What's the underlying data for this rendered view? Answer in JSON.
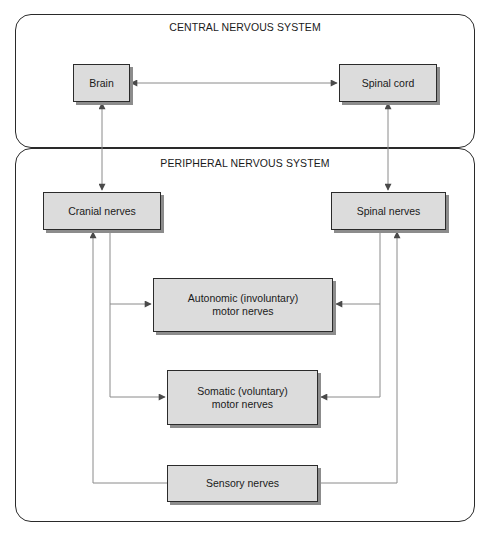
{
  "diagram": {
    "panels": {
      "central": {
        "label": "CENTRAL NERVOUS SYSTEM"
      },
      "peripheral": {
        "label": "PERIPHERAL NERVOUS SYSTEM"
      }
    },
    "nodes": {
      "brain": {
        "label": "Brain"
      },
      "spinal_cord": {
        "label": "Spinal cord"
      },
      "cranial_nerves": {
        "label": "Cranial nerves"
      },
      "spinal_nerves": {
        "label": "Spinal nerves"
      },
      "autonomic": {
        "label": "Autonomic (involuntary)\nmotor nerves"
      },
      "somatic": {
        "label": "Somatic (voluntary)\nmotor nerves"
      },
      "sensory": {
        "label": "Sensory nerves"
      }
    },
    "edges": [
      {
        "from": "Brain",
        "to": "Spinal cord",
        "direction": "bidirectional"
      },
      {
        "from": "Brain",
        "to": "Cranial nerves",
        "direction": "bidirectional"
      },
      {
        "from": "Spinal cord",
        "to": "Spinal nerves",
        "direction": "bidirectional"
      },
      {
        "from": "Cranial nerves",
        "to": "Autonomic (involuntary) motor nerves",
        "direction": "forward"
      },
      {
        "from": "Cranial nerves",
        "to": "Somatic (voluntary) motor nerves",
        "direction": "forward"
      },
      {
        "from": "Spinal nerves",
        "to": "Autonomic (involuntary) motor nerves",
        "direction": "forward"
      },
      {
        "from": "Spinal nerves",
        "to": "Somatic (voluntary) motor nerves",
        "direction": "forward"
      },
      {
        "from": "Sensory nerves",
        "to": "Cranial nerves",
        "direction": "forward"
      },
      {
        "from": "Sensory nerves",
        "to": "Spinal nerves",
        "direction": "forward"
      }
    ],
    "colors": {
      "box_fill": "#dcdcdc",
      "box_border": "#2b2b2b",
      "box_shadow": "#8c8c8c",
      "connector": "#8a8a8a",
      "arrowhead": "#4a4a4a",
      "panel_border": "#2a2a2a"
    }
  }
}
